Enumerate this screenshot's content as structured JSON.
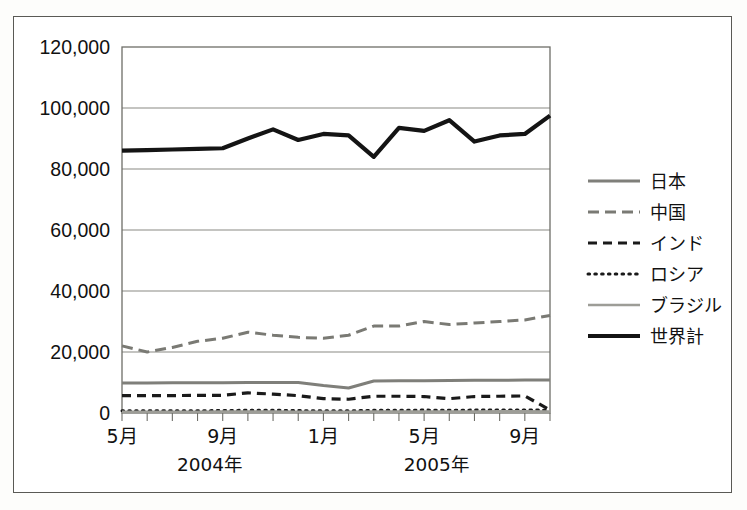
{
  "figure": {
    "background_color": "#ffffff",
    "border_color": "#5a5a55",
    "plot_border_color": "#6e6e68",
    "gridline_color": "#8a8a84"
  },
  "chart_data": {
    "type": "line",
    "title": "",
    "subtitle": "",
    "xlabel": "",
    "ylabel": "",
    "ylim": [
      0,
      120000
    ],
    "ytick_values": [
      0,
      20000,
      40000,
      60000,
      80000,
      100000,
      120000
    ],
    "ytick_labels": [
      "0",
      "20,000",
      "40,000",
      "60,000",
      "80,000",
      "100,000",
      "120,000"
    ],
    "grid": true,
    "legend_position": "right",
    "x": [
      "2004-05",
      "2004-06",
      "2004-07",
      "2004-08",
      "2004-09",
      "2004-10",
      "2004-11",
      "2004-12",
      "2005-01",
      "2005-02",
      "2005-03",
      "2005-04",
      "2005-05",
      "2005-06",
      "2005-07",
      "2005-08",
      "2005-09",
      "2005-10"
    ],
    "xtick_labels": [
      "5月",
      "9月",
      "1月",
      "5月",
      "9月"
    ],
    "xtick_indices": [
      0,
      4,
      8,
      12,
      16
    ],
    "year_groups": [
      {
        "label": "2004年",
        "start_index": 0,
        "end_index": 7
      },
      {
        "label": "2005年",
        "start_index": 8,
        "end_index": 17
      }
    ],
    "series": [
      {
        "name": "日本",
        "style": "solid",
        "color": "#7f7f7a",
        "width": 3.0,
        "values": [
          9800,
          9850,
          9900,
          9900,
          9950,
          10000,
          10000,
          10000,
          9000,
          8200,
          10500,
          10600,
          10600,
          10650,
          10700,
          10750,
          10800,
          10800
        ]
      },
      {
        "name": "中国",
        "style": "dashed",
        "color": "#7a7a74",
        "width": 3.0,
        "values": [
          22000,
          20000,
          21500,
          23500,
          24500,
          26500,
          25500,
          24800,
          24500,
          25500,
          28500,
          28500,
          30000,
          29000,
          29500,
          30000,
          30500,
          32000
        ]
      },
      {
        "name": "インド",
        "style": "dashed-bold",
        "color": "#1a1a1a",
        "width": 3.2,
        "values": [
          5700,
          5700,
          5700,
          5800,
          5800,
          6600,
          6200,
          5700,
          4700,
          4500,
          5500,
          5500,
          5400,
          4700,
          5400,
          5500,
          5600,
          1000
        ]
      },
      {
        "name": "ロシア",
        "style": "dotted",
        "color": "#1a1a1a",
        "width": 3.0,
        "values": [
          700,
          700,
          750,
          750,
          800,
          900,
          900,
          800,
          700,
          700,
          900,
          900,
          950,
          900,
          950,
          1000,
          1000,
          900
        ]
      },
      {
        "name": "ブラジル",
        "style": "solid-light",
        "color": "#9d9d97",
        "width": 2.6,
        "values": [
          400,
          400,
          420,
          420,
          450,
          480,
          470,
          430,
          400,
          400,
          470,
          480,
          500,
          480,
          500,
          520,
          520,
          480
        ]
      },
      {
        "name": "世界計",
        "style": "solid-bold",
        "color": "#141414",
        "width": 4.2,
        "values": [
          86000,
          86200,
          86400,
          86600,
          86800,
          90000,
          93000,
          89500,
          91500,
          91000,
          84000,
          93500,
          92500,
          96000,
          89000,
          91000,
          91500,
          97500
        ]
      }
    ]
  },
  "legend": {
    "items": [
      {
        "label": "日本"
      },
      {
        "label": "中国"
      },
      {
        "label": "インド"
      },
      {
        "label": "ロシア"
      },
      {
        "label": "ブラジル"
      },
      {
        "label": "世界計"
      }
    ]
  }
}
